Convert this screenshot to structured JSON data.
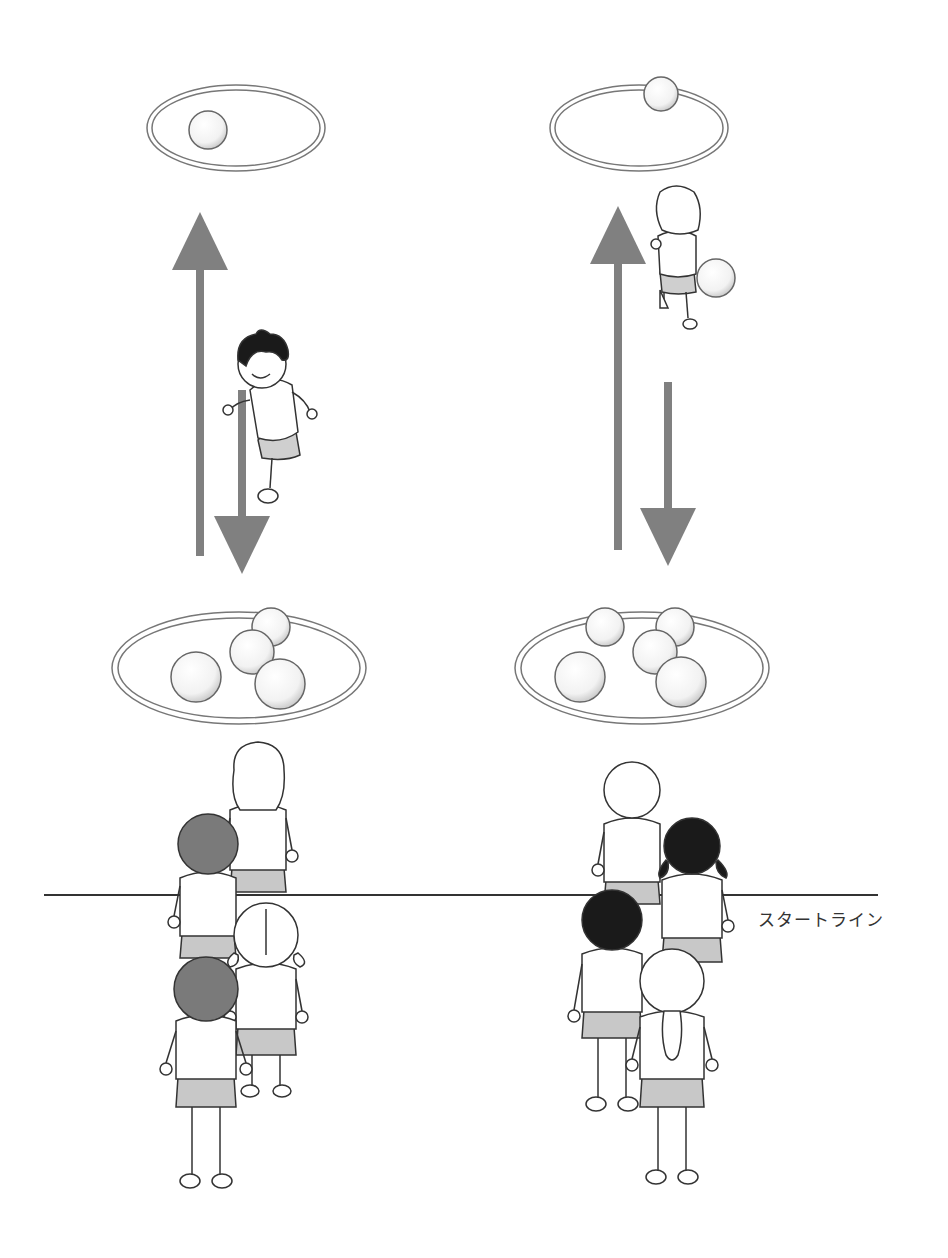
{
  "start_line": {
    "label": "スタートライン",
    "color": "#333333"
  },
  "colors": {
    "arrow": "#808080",
    "hoop_stroke": "#777777",
    "ball_fill": "#f4f4f4",
    "shorts": "#c8c8c8",
    "hair_dark": "#1a1a1a",
    "hair_gray": "#7a7a7a"
  },
  "lanes": [
    {
      "name": "left-lane",
      "far_hoop_balls": 1,
      "near_hoop_balls": 4,
      "runner": "boy running back to line",
      "queue_children": 4
    },
    {
      "name": "right-lane",
      "far_hoop_balls": 1,
      "near_hoop_balls": 5,
      "runner": "child carrying ball to far hoop",
      "queue_children": 4
    }
  ]
}
